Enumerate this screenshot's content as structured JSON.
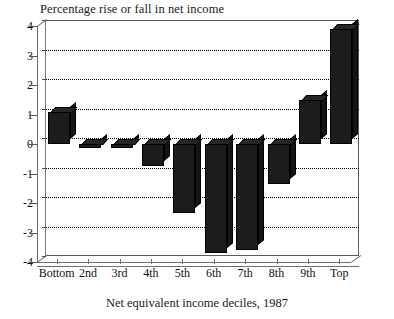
{
  "chart_data": {
    "type": "bar",
    "title": "Percentage rise or fall in net income",
    "xlabel": "Net equivalent income deciles, 1987",
    "ylabel": "",
    "categories": [
      "Bottom",
      "2nd",
      "3rd",
      "4th",
      "5th",
      "6th",
      "7th",
      "8th",
      "9th",
      "Top"
    ],
    "values": [
      1.1,
      -0.15,
      -0.15,
      -0.75,
      -2.35,
      -3.7,
      -3.6,
      -1.35,
      1.5,
      3.9
    ],
    "ylim": [
      -4,
      4
    ],
    "ytick_labels": [
      "4",
      "3",
      "2",
      "1",
      "0",
      "-1",
      "-2",
      "-3",
      "-4"
    ],
    "ytick_values": [
      4,
      3,
      2,
      1,
      0,
      -1,
      -2,
      -3,
      -4
    ],
    "grid": true,
    "legend": false,
    "style_3d": true,
    "bar_color": "#1c1c1c",
    "axis_color": "#6e6e6e",
    "gridline_color": "#000000",
    "background_color": "#ffffff"
  }
}
